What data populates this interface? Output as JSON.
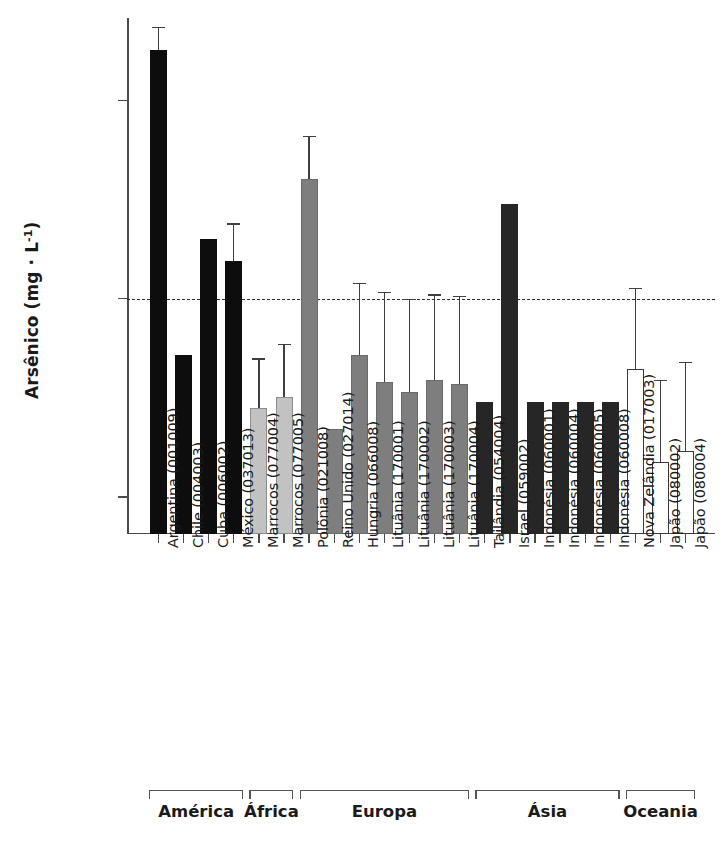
{
  "chart_data": {
    "type": "bar",
    "title": "",
    "xlabel": "",
    "ylabel": "Arsênico (mg · L⁻¹)",
    "ylabel_main": "Arsênico (mg · L",
    "ylabel_exp": "-1",
    "ylabel_close": ")",
    "yscale": "log",
    "ylim": [
      0.00065,
      0.26
    ],
    "grid": false,
    "legend": "none",
    "ytick_labels": [
      "0,100",
      "0,010",
      "0,001"
    ],
    "ytick_values": [
      0.1,
      0.01,
      0.001
    ],
    "threshold_line": {
      "value": 0.01,
      "style": "dashed",
      "label": ""
    },
    "categories": [
      "Argentina (001009)",
      "Chile (004003)",
      "Cuba (006002)",
      "México (037013)",
      "Marrocos (077004)",
      "Marrocos (077005)",
      "Polônia (021008)",
      "Reino Unido (027014)",
      "Hungria (066008)",
      "Lituânia (170001)",
      "Lituânia (170002)",
      "Lituânia (170003)",
      "Lituânia (170004)",
      "Tailândia (054004)",
      "Israel (059002)",
      "Indonésia (060001)",
      "Indonésia (060004)",
      "Indonésia (060005)",
      "Indonésia (060008)",
      "Nova Zelândia (017003)",
      "Japão (080002)",
      "Japão (080004)"
    ],
    "values": [
      0.18,
      0.0052,
      0.02,
      0.0155,
      0.0028,
      0.0032,
      0.04,
      0.0022,
      0.0052,
      0.0038,
      0.0034,
      0.0039,
      0.0037,
      0.003,
      0.03,
      0.003,
      0.003,
      0.003,
      0.003,
      0.0044,
      0.0015,
      0.0017
    ],
    "errors_upper": [
      0.235,
      null,
      null,
      0.024,
      0.005,
      0.0059,
      0.066,
      null,
      0.012,
      0.0108,
      0.01,
      0.0105,
      0.0103,
      null,
      null,
      null,
      null,
      null,
      null,
      0.0113,
      0.0039,
      0.0048
    ],
    "bar_styles": [
      "black",
      "black",
      "black",
      "black",
      "lightgray",
      "lightgray",
      "midgray",
      "midgray",
      "midgray",
      "midgray",
      "midgray",
      "midgray",
      "midgray",
      "dark",
      "dark",
      "dark",
      "dark",
      "dark",
      "dark",
      "white",
      "white",
      "white"
    ],
    "groups": [
      {
        "label": "América",
        "start": 0,
        "end": 3
      },
      {
        "label": "África",
        "start": 4,
        "end": 5
      },
      {
        "label": "Europa",
        "start": 6,
        "end": 12
      },
      {
        "label": "Ásia",
        "start": 13,
        "end": 18
      },
      {
        "label": "Oceania",
        "start": 19,
        "end": 21
      }
    ]
  }
}
